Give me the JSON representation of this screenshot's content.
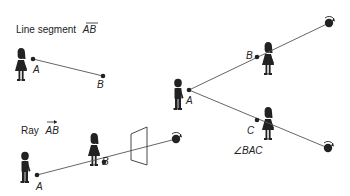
{
  "diagram": {
    "line_segment": {
      "caption_prefix": "Line segment",
      "caption_name": "AB",
      "points": {
        "A": "A",
        "B": "B"
      }
    },
    "ray": {
      "caption_prefix": "Ray",
      "caption_name": "AB",
      "points": {
        "A": "A",
        "B": "B"
      }
    },
    "angle": {
      "caption": "∠BAC",
      "points": {
        "A": "A",
        "B": "B",
        "C": "C"
      }
    },
    "colors": {
      "ink": "#222222",
      "line": "#555555",
      "background": "#ffffff"
    }
  }
}
